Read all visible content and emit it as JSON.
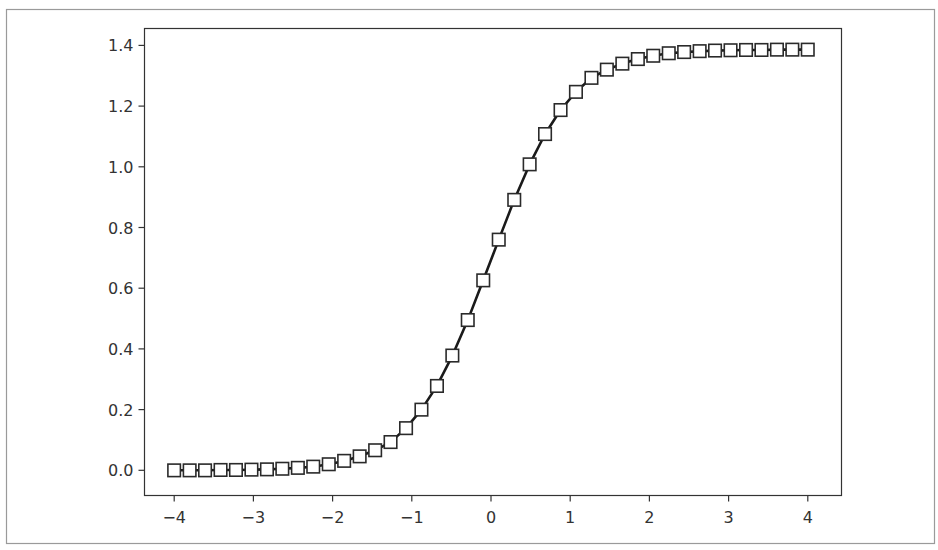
{
  "figure": {
    "frame_color": "#9a9a9a",
    "axes_color": "#333333",
    "line_color": "#1a1a1a",
    "marker_edge_color": "#2a2a2a",
    "marker_face_color": "#ffffff",
    "tick_label_color": "#333333"
  },
  "chart_data": {
    "type": "line",
    "title": "",
    "xlabel": "",
    "ylabel": "",
    "xlim": [
      -4.2,
      4.4
    ],
    "ylim": [
      -0.07,
      1.46
    ],
    "grid": false,
    "legend": null,
    "marker": "square",
    "x_ticks": [
      -4,
      -3,
      -2,
      -1,
      0,
      1,
      2,
      3,
      4
    ],
    "x_tick_labels": [
      "−4",
      "−3",
      "−2",
      "−1",
      "0",
      "1",
      "2",
      "3",
      "4"
    ],
    "y_ticks": [
      0.0,
      0.2,
      0.4,
      0.6,
      0.8,
      1.0,
      1.2,
      1.4
    ],
    "y_tick_labels": [
      "0.0",
      "0.2",
      "0.4",
      "0.6",
      "0.8",
      "1.0",
      "1.2",
      "1.4"
    ],
    "series": [
      {
        "name": "sigmoid-curve",
        "x": [
          -4.0,
          -3.805,
          -3.61,
          -3.415,
          -3.22,
          -3.024,
          -2.829,
          -2.634,
          -2.439,
          -2.244,
          -2.049,
          -1.854,
          -1.659,
          -1.463,
          -1.268,
          -1.073,
          -0.878,
          -0.683,
          -0.488,
          -0.293,
          -0.098,
          0.098,
          0.293,
          0.488,
          0.683,
          0.878,
          1.073,
          1.268,
          1.463,
          1.659,
          1.854,
          2.049,
          2.244,
          2.439,
          2.634,
          2.829,
          3.024,
          3.22,
          3.415,
          3.61,
          3.805,
          4.0
        ],
        "y": [
          0.0,
          0.0,
          0.0,
          0.001,
          0.001,
          0.002,
          0.003,
          0.005,
          0.008,
          0.012,
          0.02,
          0.031,
          0.046,
          0.066,
          0.093,
          0.139,
          0.2,
          0.278,
          0.378,
          0.495,
          0.626,
          0.76,
          0.891,
          1.008,
          1.108,
          1.187,
          1.247,
          1.293,
          1.32,
          1.34,
          1.355,
          1.366,
          1.374,
          1.378,
          1.381,
          1.383,
          1.384,
          1.385,
          1.385,
          1.386,
          1.386,
          1.386
        ]
      }
    ]
  }
}
